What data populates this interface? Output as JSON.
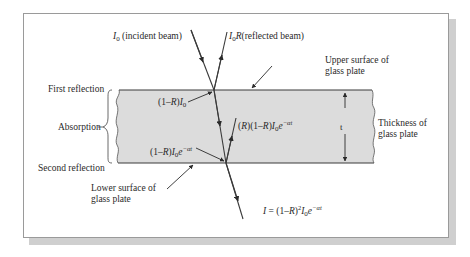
{
  "diagram": {
    "colors": {
      "plate_fill": "#dcdcdc",
      "line": "#3a3a3a",
      "panel_border": "#9a9a9a",
      "shadow": "#cfcfcf"
    },
    "labels": {
      "incident": {
        "symbol": "I",
        "sub": "0",
        "text": " (incident beam)"
      },
      "reflected": {
        "symbol": "I",
        "sub": "0",
        "symbol2": "R",
        "text": "(reflected beam)"
      },
      "upper_surface": {
        "line1": "Upper surface of",
        "line2": "glass plate"
      },
      "lower_surface": {
        "line1": "Lower surface of",
        "line2": "glass plate"
      },
      "thickness": {
        "line1": "Thickness of",
        "line2": "glass plate",
        "symbol": "t"
      },
      "first_reflection": "First reflection",
      "absorption": "Absorption",
      "second_reflection": "Second reflection",
      "transmitted_top": {
        "pre": "(1–",
        "R": "R",
        "mid": ")",
        "I": "I",
        "sub": "0"
      },
      "internal_reflected": {
        "pre": "(",
        "R": "R",
        "mid": ")(1–",
        "R2": "R",
        "mid2": ")",
        "I": "I",
        "sub": "0",
        "e": "e",
        "exp": "−αt"
      },
      "attenuated": {
        "pre": "(1–",
        "R": "R",
        "mid": ")",
        "I": "I",
        "sub": "0",
        "e": "e",
        "exp": "−αt"
      },
      "output": {
        "I": "I",
        "eq": " = (1–",
        "R": "R",
        "mid": ")",
        "pow": "2",
        "I0": "I",
        "sub": "0",
        "e": "e",
        "exp": "−αt"
      }
    }
  }
}
